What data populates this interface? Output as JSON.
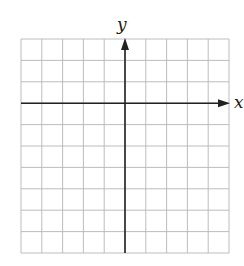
{
  "diagram": {
    "type": "coordinate-grid",
    "x_axis_label": "x",
    "y_axis_label": "y",
    "grid": {
      "columns": 10,
      "rows": 10,
      "left": 21,
      "top": 39,
      "right": 229,
      "bottom": 253,
      "line_color": "#b5b5b5",
      "line_width": 0.9
    },
    "axes": {
      "x_axis_row": 3,
      "y_axis_column": 5,
      "color": "#222222",
      "width": 1.6,
      "x_arrow": "right",
      "y_arrow": "up"
    }
  }
}
